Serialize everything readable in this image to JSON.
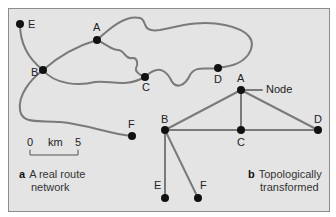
{
  "panel_a": {
    "letter": "a",
    "caption_line1": "A real route",
    "caption_line2": "network",
    "nodes": {
      "E": "E",
      "A": "A",
      "B": "B",
      "C": "C",
      "D": "D",
      "F": "F"
    },
    "scale": {
      "start": "0",
      "unit": "km",
      "end": "5"
    }
  },
  "panel_b": {
    "letter": "b",
    "caption_line1": "Topologically",
    "caption_line2": "transformed",
    "nodes": {
      "A": "A",
      "B": "B",
      "C": "C",
      "D": "D",
      "E": "E",
      "F": "F"
    },
    "node_callout": "Node"
  },
  "colors": {
    "background": "#e4e4e4",
    "route": "#7a7a7a",
    "node": "#111111"
  }
}
